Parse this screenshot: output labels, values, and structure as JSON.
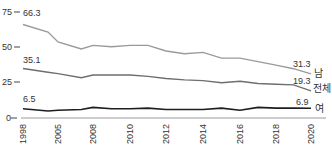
{
  "chart_data": {
    "type": "line",
    "title": "",
    "xlabel": "",
    "ylabel": "",
    "ylim": [
      0,
      75
    ],
    "yticks": [
      0,
      25,
      50,
      75
    ],
    "x_tick_labels": [
      "1998",
      "2005",
      "2008",
      "2010",
      "2012",
      "2014",
      "2016",
      "2018",
      "2020"
    ],
    "x": [
      1998,
      2003,
      2005,
      2007,
      2008,
      2009,
      2010,
      2011,
      2012,
      2013,
      2014,
      2015,
      2016,
      2017,
      2018,
      2019,
      2020
    ],
    "series": [
      {
        "name": "남",
        "color": "#9a9a9a",
        "values": [
          66.3,
          61.0,
          54.0,
          49.0,
          51.5,
          50.5,
          51.5,
          51.5,
          47.5,
          45.5,
          46.5,
          42.5,
          42.5,
          40.0,
          37.5,
          35.0,
          31.3
        ],
        "start_label": "66.3",
        "end_label": "31.3"
      },
      {
        "name": "전체",
        "color": "#6e6e6e",
        "values": [
          35.1,
          32.5,
          31.5,
          28.5,
          30.5,
          30.5,
          30.5,
          29.5,
          28.0,
          27.0,
          26.5,
          25.0,
          26.0,
          24.5,
          24.0,
          23.5,
          19.3
        ],
        "start_label": "35.1",
        "end_label": "19.3"
      },
      {
        "name": "여",
        "color": "#1e1e1e",
        "values": [
          6.5,
          5.0,
          5.5,
          6.0,
          7.5,
          6.5,
          6.5,
          7.0,
          6.0,
          6.0,
          6.0,
          7.0,
          5.5,
          7.5,
          7.0,
          7.0,
          6.9
        ],
        "start_label": "6.5",
        "end_label": "6.9"
      }
    ],
    "legend_position": "right-inline",
    "grid": false
  },
  "axis": {
    "y_labels": [
      "75",
      "50",
      "25",
      "0"
    ]
  },
  "series_labels": {
    "male": "남",
    "total": "전체",
    "female": "여"
  }
}
